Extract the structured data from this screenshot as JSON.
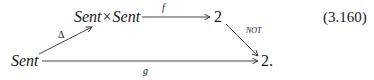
{
  "diagram": {
    "type": "commutative-diagram",
    "nodes": {
      "product": {
        "label_left": "Sent",
        "times": "×",
        "label_right": "Sent"
      },
      "two_top": {
        "label": "2"
      },
      "sent": {
        "label": "Sent"
      },
      "two_bottom": {
        "label": "2."
      }
    },
    "arrows": {
      "delta": {
        "label": "Δ",
        "from": "Sent",
        "to": "Sent × Sent"
      },
      "f": {
        "label": "f",
        "from": "Sent × Sent",
        "to": "2"
      },
      "not": {
        "label": "NOT",
        "from": "2",
        "to": "2"
      },
      "g": {
        "label": "g",
        "from": "Sent",
        "to": "2"
      }
    },
    "equation_number": "(3.160)",
    "colors": {
      "ink": "#1a1a1a",
      "background": "#ffffff"
    }
  }
}
